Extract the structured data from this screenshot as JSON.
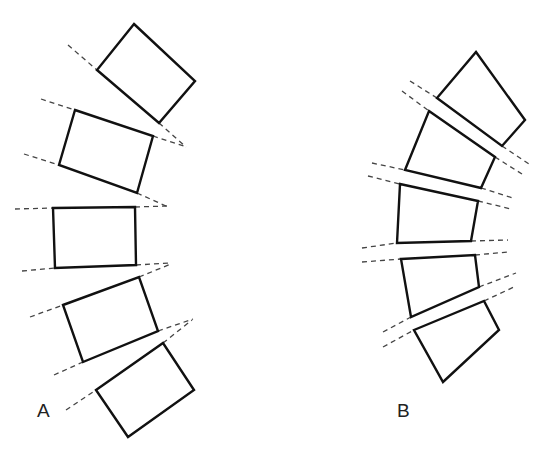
{
  "figure": {
    "panels": [
      {
        "id": "A",
        "label": "A",
        "block_shape": "rectangle",
        "block_count": 5,
        "description": "Vertebral bodies as rectangles, tilted, with divergent dashed endplate lines"
      },
      {
        "id": "B",
        "label": "B",
        "block_shape": "wedge",
        "block_count": 5,
        "description": "Vertebral bodies as wedges, with parallel double dashed endplate lines"
      }
    ],
    "colors": {
      "stroke": "#111111",
      "dash": "#444444",
      "background": "#ffffff"
    }
  }
}
